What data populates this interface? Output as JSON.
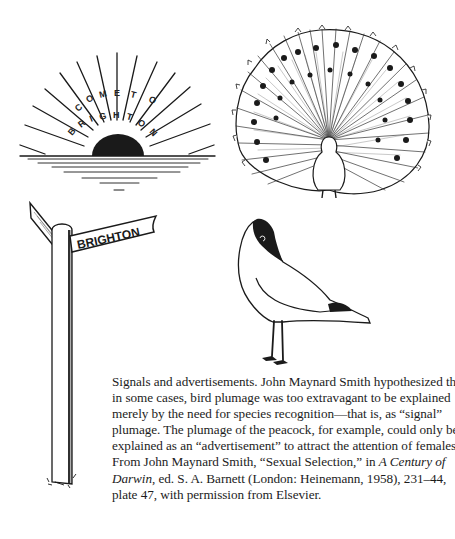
{
  "figure": {
    "illustrations": [
      {
        "id": "sunburst",
        "description": "Sunburst poster with rising sun",
        "text_top": "COME TO",
        "text_bottom": "BRIGHTON"
      },
      {
        "id": "peacock",
        "description": "Peacock with fanned tail display"
      },
      {
        "id": "signpost",
        "description": "Wooden signpost",
        "sign_label": "BRIGHTON"
      },
      {
        "id": "gull",
        "description": "Black-headed gull standing"
      }
    ],
    "caption": {
      "lines": [
        "Signals and advertisements. John Maynard Smith hypothesized that",
        "in some cases, bird plumage was too extravagant to be explained",
        "merely by the need for species recognition—that is, as “signal”",
        "plumage. The plumage of the peacock, for example, could only be",
        "explained as an “advertisement” to attract the attention of females.",
        "From John Maynard Smith, “Sexual Selection,” in ",
        "Darwin",
        ", ed. S. A. Barnett (London: Heinemann, 1958), 231–44,",
        "plate 47, with permission from Elsevier."
      ],
      "italic_title_part1": "A Century of",
      "italic_title_part2": "Darwin"
    }
  },
  "colors": {
    "ink": "#1a1a1a",
    "paper": "#ffffff"
  }
}
